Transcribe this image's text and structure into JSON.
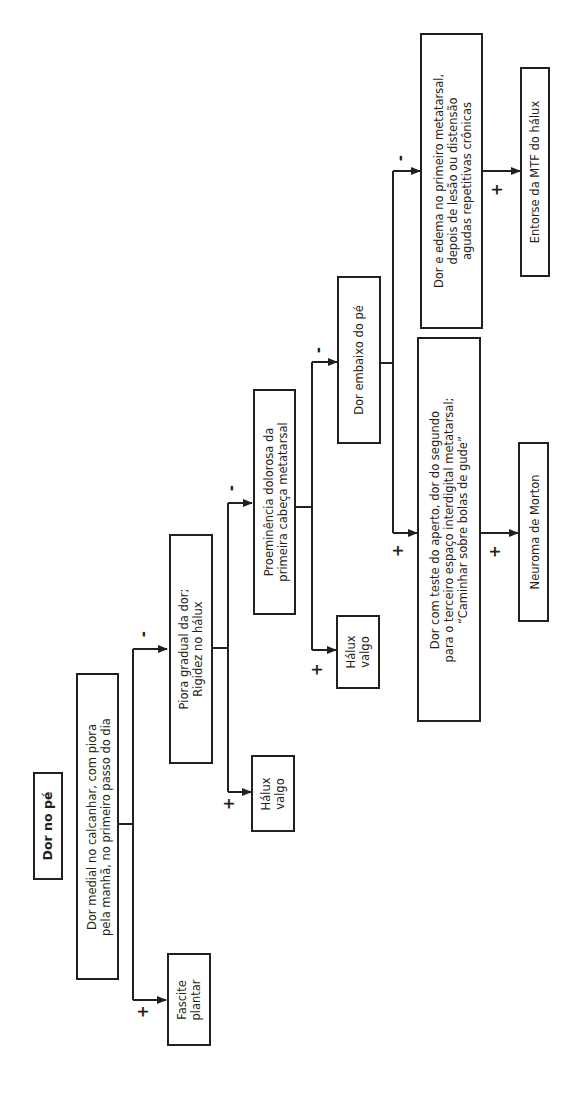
{
  "diagram": {
    "title": "Dor no pé",
    "nodes": [
      {
        "id": "q1",
        "text": "Dor medial no calcanhar, com piora\npela manhã, no primeiro passo do dia"
      },
      {
        "id": "r1",
        "text": "Fascite\nplantar"
      },
      {
        "id": "q2",
        "text": "Piora gradual da dor;\nRigidez no hálux"
      },
      {
        "id": "r2",
        "text": "Hálux\nvalgo"
      },
      {
        "id": "q3",
        "text": "Proeminência dolorosa da\nprimeira cabeça metatarsal"
      },
      {
        "id": "r3",
        "text": "Hálux\nvalgo"
      },
      {
        "id": "q4",
        "text": "Dor embaixo do pé"
      },
      {
        "id": "q5",
        "text": "Dor com teste do aperto, dor do segundo\npara o terceiro espaço interdigital metatarsal;\n“Caminhar sobre bolas de gude”"
      },
      {
        "id": "r5",
        "text": "Neuroma de Morton"
      },
      {
        "id": "q6",
        "text": "Dor e edema no primeiro metatarsal,\ndepois de lesão ou distensão\nagudas repetitivas crônicas"
      },
      {
        "id": "r6",
        "text": "Entorse da MTF do hálux"
      }
    ],
    "labels": {
      "yes": "+",
      "no": "-"
    },
    "edges": [
      {
        "from": "title",
        "to": "q1"
      },
      {
        "from": "q1",
        "to": "r1",
        "label": "+"
      },
      {
        "from": "q1",
        "to": "q2",
        "label": "-"
      },
      {
        "from": "q2",
        "to": "r2",
        "label": "+"
      },
      {
        "from": "q2",
        "to": "q3",
        "label": "-"
      },
      {
        "from": "q3",
        "to": "r3",
        "label": "+"
      },
      {
        "from": "q3",
        "to": "q4",
        "label": "-"
      },
      {
        "from": "q4",
        "to": "q5",
        "label": "+"
      },
      {
        "from": "q4",
        "to": "q6",
        "label": "-"
      },
      {
        "from": "q5",
        "to": "r5",
        "label": "+"
      },
      {
        "from": "q6",
        "to": "r6",
        "label": "+"
      }
    ],
    "orientation": "rotated-90-ccw"
  }
}
